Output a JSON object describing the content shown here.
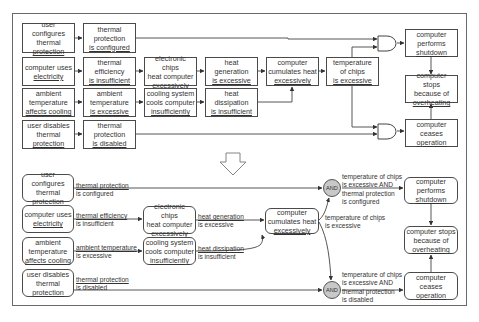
{
  "top_diagram": {
    "boxes": [
      {
        "id": "t_user_cfg",
        "lines": [
          "user configures",
          "thermal",
          "protection"
        ],
        "x": 22,
        "y": 23,
        "w": 53,
        "h": 30
      },
      {
        "id": "t_tp_cfg",
        "lines": [
          "thermal",
          "protection",
          "is configured"
        ],
        "x": 83,
        "y": 23,
        "w": 53,
        "h": 30
      },
      {
        "id": "t_uses_elec",
        "lines": [
          "computer uses",
          "electricity"
        ],
        "x": 22,
        "y": 57,
        "w": 53,
        "h": 29
      },
      {
        "id": "t_th_eff",
        "lines": [
          "thermal",
          "efficiency",
          "is insufficient"
        ],
        "x": 83,
        "y": 57,
        "w": 53,
        "h": 29
      },
      {
        "id": "t_chips_heat",
        "lines": [
          "electronic chips",
          "heat computer",
          "excessively"
        ],
        "x": 144,
        "y": 57,
        "w": 53,
        "h": 29
      },
      {
        "id": "t_heat_gen",
        "lines": [
          "heat",
          "generation",
          "is excessive"
        ],
        "x": 205,
        "y": 57,
        "w": 53,
        "h": 29
      },
      {
        "id": "t_cumulates",
        "lines": [
          "computer",
          "cumulates heat",
          "excessively"
        ],
        "x": 266,
        "y": 57,
        "w": 53,
        "h": 29
      },
      {
        "id": "t_temp_chips",
        "lines": [
          "temperature",
          "of chips",
          "is excessive"
        ],
        "x": 326,
        "y": 57,
        "w": 53,
        "h": 29
      },
      {
        "id": "t_ambient",
        "lines": [
          "ambient",
          "temperature",
          "affects cooling"
        ],
        "x": 22,
        "y": 88,
        "w": 53,
        "h": 29
      },
      {
        "id": "t_amb_exc",
        "lines": [
          "ambient",
          "temperature",
          "is excessive"
        ],
        "x": 83,
        "y": 88,
        "w": 53,
        "h": 29
      },
      {
        "id": "t_cooling",
        "lines": [
          "cooling system",
          "cools computer",
          "insufficiently"
        ],
        "x": 144,
        "y": 88,
        "w": 53,
        "h": 29
      },
      {
        "id": "t_heat_diss",
        "lines": [
          "heat",
          "dissipation",
          "is insufficient"
        ],
        "x": 205,
        "y": 88,
        "w": 53,
        "h": 29
      },
      {
        "id": "t_user_dis",
        "lines": [
          "user disables",
          "thermal",
          "protection"
        ],
        "x": 22,
        "y": 120,
        "w": 53,
        "h": 29
      },
      {
        "id": "t_tp_dis",
        "lines": [
          "thermal",
          "protection",
          "is disabled"
        ],
        "x": 83,
        "y": 120,
        "w": 53,
        "h": 29
      },
      {
        "id": "t_shutdown",
        "lines": [
          "computer",
          "performs",
          "shutdown"
        ],
        "x": 405,
        "y": 29,
        "w": 53,
        "h": 28
      },
      {
        "id": "t_stops",
        "lines": [
          "computer stops",
          "because of",
          "overheating"
        ],
        "x": 405,
        "y": 75,
        "w": 53,
        "h": 28
      },
      {
        "id": "t_ceases",
        "lines": [
          "computer",
          "ceases",
          "operation"
        ],
        "x": 405,
        "y": 119,
        "w": 53,
        "h": 28
      }
    ]
  },
  "bottom_diagram": {
    "boxes": [
      {
        "id": "b_user_cfg",
        "lines": [
          "user configures",
          "thermal",
          "protection"
        ],
        "x": 22,
        "y": 174,
        "w": 52,
        "h": 28
      },
      {
        "id": "b_uses_elec",
        "lines": [
          "computer uses",
          "electricity"
        ],
        "x": 22,
        "y": 205,
        "w": 52,
        "h": 28
      },
      {
        "id": "b_ambient",
        "lines": [
          "ambient",
          "temperature",
          "affects cooling"
        ],
        "x": 22,
        "y": 237,
        "w": 52,
        "h": 28
      },
      {
        "id": "b_user_dis",
        "lines": [
          "user disables",
          "thermal",
          "protection"
        ],
        "x": 22,
        "y": 269,
        "w": 52,
        "h": 28
      },
      {
        "id": "b_chips_heat",
        "lines": [
          "electronic chips",
          "heat computer",
          "excessively"
        ],
        "x": 143,
        "y": 206,
        "w": 53,
        "h": 28
      },
      {
        "id": "b_cooling",
        "lines": [
          "cooling system",
          "cools computer",
          "insufficiently"
        ],
        "x": 143,
        "y": 237,
        "w": 53,
        "h": 28
      },
      {
        "id": "b_cumulates",
        "lines": [
          "computer",
          "cumulates heat",
          "excessively"
        ],
        "x": 265,
        "y": 208,
        "w": 54,
        "h": 26
      },
      {
        "id": "b_shutdown",
        "lines": [
          "computer",
          "performs",
          "shutdown"
        ],
        "x": 404,
        "y": 177,
        "w": 54,
        "h": 27
      },
      {
        "id": "b_stops",
        "lines": [
          "computer stops",
          "because of",
          "overheating"
        ],
        "x": 404,
        "y": 226,
        "w": 54,
        "h": 28
      },
      {
        "id": "b_ceases",
        "lines": [
          "computer",
          "ceases",
          "operation"
        ],
        "x": 404,
        "y": 272,
        "w": 54,
        "h": 28
      }
    ],
    "edge_labels": [
      {
        "id": "l_tp_cfg",
        "lines": [
          "thermal protection",
          "is configured"
        ],
        "x": 76,
        "y": 182
      },
      {
        "id": "l_th_eff",
        "lines": [
          "thermal efficiency",
          "is insufficient"
        ],
        "x": 76,
        "y": 212
      },
      {
        "id": "l_amb_exc",
        "lines": [
          "ambient temperature",
          "is excessive"
        ],
        "x": 76,
        "y": 244
      },
      {
        "id": "l_tp_dis",
        "lines": [
          "thermal protection",
          "is disabled"
        ],
        "x": 76,
        "y": 276
      },
      {
        "id": "l_heat_gen",
        "lines": [
          "heat generation",
          "is excessive"
        ],
        "x": 198,
        "y": 213
      },
      {
        "id": "l_heat_diss",
        "lines": [
          "heat dissipation",
          "is insufficient"
        ],
        "x": 198,
        "y": 245
      },
      {
        "id": "l_temp_chips",
        "lines": [
          "temperature of chips",
          "is excessive"
        ],
        "x": 325,
        "y": 214
      },
      {
        "id": "l_and_top",
        "lines": [
          "temperature of chips",
          "is excessive AND",
          "thermal protection",
          "is configured"
        ],
        "x": 342,
        "y": 173
      },
      {
        "id": "l_and_bot",
        "lines": [
          "temperature of chips",
          "is excessive AND",
          "thermal protection",
          "is disabled"
        ],
        "x": 342,
        "y": 271
      }
    ],
    "and_nodes": [
      {
        "id": "and_top",
        "label": "AND",
        "cx": 332,
        "cy": 188
      },
      {
        "id": "and_bot",
        "label": "AND",
        "cx": 332,
        "cy": 290
      }
    ]
  },
  "transform_arrow": {
    "label": "down-arrow"
  },
  "colors": {
    "stroke": "#4a4a4a",
    "and_fill": "#c8c8c8",
    "frame": "#6a6a6a",
    "text": "#333333"
  }
}
